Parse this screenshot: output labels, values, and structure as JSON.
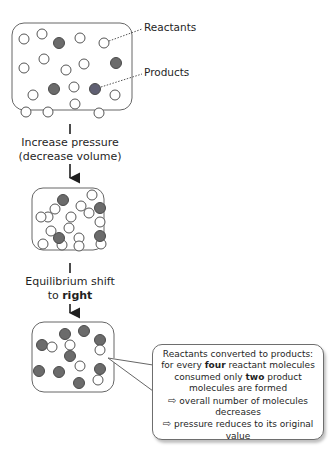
{
  "labels": {
    "reactants": "Reactants",
    "products": "Products"
  },
  "steps": {
    "step1_line1": "Increase pressure",
    "step1_line2": "(decrease volume)",
    "step2_line1": "Equilibrium shift",
    "step2_prefix": "to ",
    "step2_bold": "right"
  },
  "callout": {
    "line1": "Reactants converted to products:",
    "line2_a": "for every ",
    "line2_bold": "four",
    "line2_b": " reactant molecules",
    "line3_a": "consumed only ",
    "line3_bold": "two",
    "line3_b": " product",
    "line4": "molecules are formed",
    "arrow_symbol": "⇨",
    "line5": "overall number of molecules",
    "line6": "decreases",
    "line7": "pressure reduces to its original",
    "line8": "value"
  },
  "colors": {
    "reactant_fill": "#ffffff",
    "product_fill": "#6b6b6b",
    "outline": "#555555",
    "arrow": "#1f1f1f"
  },
  "boxes": [
    {
      "name": "initial-state",
      "reactants": 16,
      "products": 4
    },
    {
      "name": "compressed-state",
      "reactants": 16,
      "products": 4
    },
    {
      "name": "new-equilibrium-state",
      "reactants": 8,
      "products": 9
    }
  ]
}
